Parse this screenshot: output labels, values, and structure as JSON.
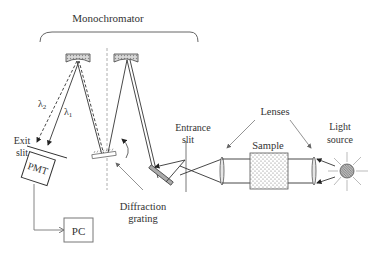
{
  "diagram": {
    "title": "Monochromator",
    "labels": {
      "lambda2": "λ",
      "lambda2_sub": "2",
      "lambda1": "λ",
      "lambda1_sub": "1",
      "exit_slit_line1": "Exit",
      "exit_slit_line2": "slit",
      "pmt": "PMT",
      "pc": "PC",
      "diffraction_line1": "Diffraction",
      "diffraction_line2": "grating",
      "entrance_line1": "Entrance",
      "entrance_line2": "slit",
      "lenses": "Lenses",
      "sample": "Sample",
      "light_line1": "Light",
      "light_line2": "source"
    },
    "colors": {
      "line": "#333333",
      "mirror_fill": "#bdbdbd",
      "arrow_gray": "#777777",
      "background": "#ffffff"
    }
  }
}
